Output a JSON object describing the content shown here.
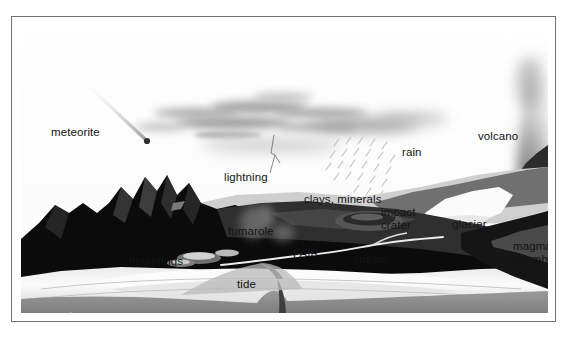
{
  "figure": {
    "caption_ghost": "",
    "scene_title": "early Earth prebiotic environment cross-section"
  },
  "labels": {
    "meteorite": "meteorite",
    "lightning": "lightning",
    "rain": "rain",
    "volcano": "volcano",
    "clays_minerals": "clays, minerals",
    "impact_crater_line1": "impact",
    "impact_crater_line2": "crater",
    "glacier": "glacier",
    "magma_chamber_line1": "magma",
    "magma_chamber_line2": "chamber",
    "fumarole": "fumarole",
    "fair": "FAIR",
    "stream": "stream",
    "hotsprings": "hotsprings",
    "tide": "tide",
    "crust": "crust",
    "vent": "vent"
  },
  "colors": {
    "frame_border": "#6f6f6f",
    "sky": "#fdfdfd",
    "cloud": "#a8a8a8",
    "mountain_dark": "#0a0a0a",
    "mountain_mid": "#3a3a3a",
    "terrain_gray": "#5d5d5d",
    "water_light": "#d8d8d8",
    "water_bright": "#f2f2f2",
    "glacier_white": "#fbfbfb",
    "crust_gray": "#8f8f8f",
    "label_dark": "#141414",
    "label_light": "#f2f2f2",
    "plume": "#7a7a7a"
  }
}
